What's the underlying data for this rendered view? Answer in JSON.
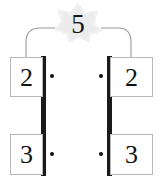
{
  "figure": {
    "width": 163,
    "height": 184,
    "background_color": "#ffffff"
  },
  "top_label": {
    "value": "5"
  },
  "highlight": {
    "shape": "star-blob",
    "color": "#f0f0f0"
  },
  "connectors": {
    "stroke_color": "#9a9a9a",
    "left": {
      "from": "top-label",
      "to": "box-left-top"
    },
    "right": {
      "from": "top-label",
      "to": "box-right-top"
    }
  },
  "bars": {
    "color": "#1a1a1a",
    "left_label": "left-vertical-bar",
    "right_label": "right-vertical-bar"
  },
  "dots": {
    "color": "#101010",
    "symbol": "multiplication-dot",
    "count": 4
  },
  "boxes": {
    "left_top": {
      "value": "2"
    },
    "left_bottom": {
      "value": "3"
    },
    "right_top": {
      "value": "2"
    },
    "right_bottom": {
      "value": "3"
    }
  }
}
